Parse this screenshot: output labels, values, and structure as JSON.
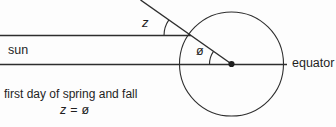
{
  "diagram": {
    "title_caption": "first day of spring and fall",
    "labels": {
      "sun": "sun",
      "zenith_angle": "z",
      "latitude_angle": "ø",
      "equator": "equator"
    },
    "equation": {
      "lhs": "z",
      "equals": "=",
      "rhs": "ø"
    },
    "colors": {
      "line": "#2e2e2e",
      "text": "#1f1f1f",
      "background": "#fdfdfd"
    }
  }
}
